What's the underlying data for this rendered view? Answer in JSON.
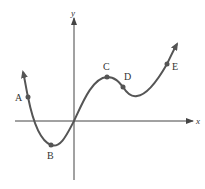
{
  "figure": {
    "axes": {
      "x_label": "x",
      "y_label": "y",
      "color": "#444444"
    },
    "curve": {
      "color": "#555555",
      "description": "Continuous curve with arrows at both ends: descends through A to local minimum B, rises through origin to local maximum C, falls through D to a local minimum, then rises through E."
    },
    "points": [
      {
        "label": "A",
        "role": "on decreasing segment, left"
      },
      {
        "label": "B",
        "role": "local minimum"
      },
      {
        "label": "C",
        "role": "local maximum"
      },
      {
        "label": "D",
        "role": "on decreasing segment after C"
      },
      {
        "label": "E",
        "role": "on increasing segment, right"
      }
    ]
  }
}
